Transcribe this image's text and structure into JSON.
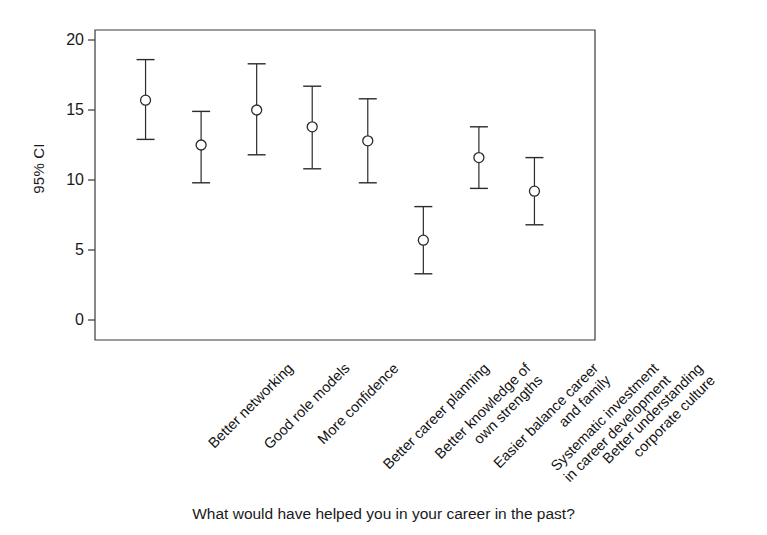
{
  "chart_data": {
    "type": "scatter",
    "title": "",
    "xlabel": "What would have helped you in your career in the past?",
    "ylabel": "95% CI",
    "ylim": [
      0,
      20
    ],
    "yticks": [
      0,
      5,
      10,
      15,
      20
    ],
    "ytick_labels": [
      "0",
      "5",
      "10",
      "15",
      "20"
    ],
    "grid": false,
    "legend": null,
    "error_bar_style": "95% confidence interval with caps",
    "marker": "open circle",
    "categories": [
      "Better networking",
      "Good role models",
      "More confidence",
      "Better career planning",
      "Better knowledge of\nown strengths",
      "Easier balance career\nand family",
      "Systematic investment\nin career development",
      "Better understanding\ncorporate culture"
    ],
    "values": [
      15.7,
      12.5,
      15.0,
      13.8,
      12.8,
      5.7,
      11.6,
      9.2
    ],
    "ci_lower": [
      12.9,
      9.8,
      11.8,
      10.8,
      9.8,
      3.3,
      9.4,
      6.8
    ],
    "ci_upper": [
      18.6,
      14.9,
      18.3,
      16.7,
      15.8,
      8.1,
      13.8,
      11.6
    ]
  },
  "axis": {
    "y_title": "95% CI",
    "x_title": "What would have helped you in your career in the past?"
  }
}
